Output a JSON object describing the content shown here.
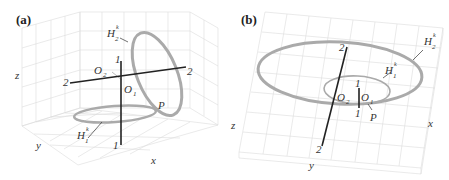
{
  "figure": {
    "panels": [
      {
        "id": "a",
        "label": "(a)",
        "axes": {
          "x": "x",
          "y": "y",
          "z": "z"
        },
        "curves": [
          {
            "name": "H",
            "sub": "2",
            "sup": "k",
            "orientation": "vertical ellipse"
          },
          {
            "name": "H",
            "sub": "1",
            "sup": "k",
            "orientation": "horizontal ellipse"
          }
        ],
        "lines": [
          {
            "name": "axis-1",
            "end_labels": [
              "1",
              "1"
            ],
            "orientation": "vertical"
          },
          {
            "name": "axis-2",
            "end_labels": [
              "2",
              "2"
            ],
            "orientation": "horizontal"
          }
        ],
        "points": [
          {
            "name": "O",
            "sub": "2"
          },
          {
            "name": "O",
            "sub": "1"
          },
          {
            "name": "P"
          }
        ]
      },
      {
        "id": "b",
        "label": "(b)",
        "axes": {
          "x": "x",
          "y": "y",
          "z": "z"
        },
        "curves": [
          {
            "name": "H",
            "sub": "2",
            "sup": "k",
            "orientation": "large horizontal ellipse"
          },
          {
            "name": "H",
            "sub": "1",
            "sup": "k",
            "orientation": "small horizontal ellipse"
          }
        ],
        "lines": [
          {
            "name": "axis-2",
            "end_labels": [
              "2",
              "2"
            ],
            "orientation": "tilted"
          },
          {
            "name": "axis-1",
            "end_labels": [
              "1",
              "1"
            ],
            "orientation": "short vertical"
          }
        ],
        "points": [
          {
            "name": "O",
            "sub": "2"
          },
          {
            "name": "O",
            "sub": "1"
          },
          {
            "name": "P"
          }
        ]
      }
    ]
  },
  "text": {
    "a_label": "(a)",
    "b_label": "(b)",
    "H": "H",
    "O": "O",
    "P": "P",
    "k": "k",
    "one": "1",
    "two": "2",
    "x": "x",
    "y": "y",
    "z": "z"
  }
}
